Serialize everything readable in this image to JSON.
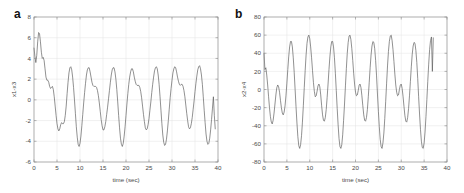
{
  "figure": {
    "background_color": "#ffffff",
    "line_color": "#555555",
    "grid_color": "#e2e2e2",
    "frame_color": "#8a8a8a",
    "text_color": "#4a4a4a"
  },
  "panels": [
    {
      "letter": "a",
      "ylabel": "x1-x3",
      "xlabel": "time (sec)"
    },
    {
      "letter": "b",
      "ylabel": "x2-x4",
      "xlabel": "time (sec)"
    }
  ],
  "chart_data": [
    {
      "type": "line",
      "panel": "a",
      "title": "",
      "xlabel": "time (sec)",
      "ylabel": "x1-x3",
      "xlim": [
        0,
        40
      ],
      "ylim": [
        -6,
        8
      ],
      "xticks": [
        0,
        5,
        10,
        15,
        20,
        25,
        30,
        35,
        40
      ],
      "xticklabels": [
        "0",
        "5",
        "10",
        "15",
        "20",
        "25",
        "30",
        "35",
        "40"
      ],
      "yticks": [
        -6,
        -4,
        -2,
        0,
        2,
        4,
        6,
        8
      ],
      "yticklabels": [
        "-6",
        "-4",
        "-2",
        "0",
        "2",
        "4",
        "6",
        "8"
      ],
      "grid": true,
      "legend": null,
      "series": [
        {
          "name": "x1-x3",
          "color": "#555555",
          "x": [
            0.0,
            0.2,
            0.4,
            0.6,
            0.8,
            1.0,
            1.2,
            1.4,
            1.6,
            1.8,
            2.0,
            2.2,
            2.4,
            2.6,
            2.8,
            3.0,
            3.2,
            3.4,
            3.6,
            3.8,
            4.0,
            4.2,
            4.4,
            4.6,
            4.8,
            5.0,
            5.2,
            5.4,
            5.6,
            5.8,
            6.0,
            6.2,
            6.4,
            6.6,
            6.8,
            7.0,
            7.2,
            7.4,
            7.6,
            7.8,
            8.0,
            8.2,
            8.4,
            8.6,
            8.8,
            9.0,
            9.2,
            9.4,
            9.6,
            9.8,
            10.0,
            10.2,
            10.4,
            10.6,
            10.8,
            11.0,
            11.2,
            11.4,
            11.6,
            11.8,
            12.0,
            12.2,
            12.4,
            12.6,
            12.8,
            13.0,
            13.2,
            13.4,
            13.6,
            13.8,
            14.0,
            14.2,
            14.4,
            14.6,
            14.8,
            15.0,
            15.2,
            15.4,
            15.6,
            15.8,
            16.0,
            16.2,
            16.4,
            16.6,
            16.8,
            17.0,
            17.2,
            17.4,
            17.6,
            17.8,
            18.0,
            18.2,
            18.4,
            18.6,
            18.8,
            19.0,
            19.2,
            19.4,
            19.6,
            19.8,
            20.0,
            20.2,
            20.4,
            20.6,
            20.8,
            21.0,
            21.2,
            21.4,
            21.6,
            21.8,
            22.0,
            22.2,
            22.4,
            22.6,
            22.8,
            23.0,
            23.2,
            23.4,
            23.6,
            23.8,
            24.0,
            24.2,
            24.4,
            24.6,
            24.8,
            25.0,
            25.2,
            25.4,
            25.6,
            25.8,
            26.0,
            26.2,
            26.4,
            26.6,
            26.8,
            27.0,
            27.2,
            27.4,
            27.6,
            27.8,
            28.0,
            28.2,
            28.4,
            28.6,
            28.8,
            29.0,
            29.2,
            29.4,
            29.6,
            29.8,
            30.0,
            30.2,
            30.4,
            30.6,
            30.8,
            31.0,
            31.2,
            31.4,
            31.6,
            31.8,
            32.0,
            32.2,
            32.4,
            32.6,
            32.8,
            33.0,
            33.2,
            33.4,
            33.6,
            33.8,
            34.0,
            34.2,
            34.4,
            34.6,
            34.8,
            35.0,
            35.2,
            35.4,
            35.6,
            35.8,
            36.0,
            36.2,
            36.4,
            36.6,
            36.8,
            37.0,
            37.2,
            37.4,
            37.6,
            37.8,
            38.0,
            38.2,
            38.4,
            38.6,
            38.8,
            39.0,
            39.2,
            39.4,
            39.6,
            39.8,
            40.0
          ],
          "y": [
            5.0,
            4.2,
            3.6,
            4.3,
            5.6,
            6.5,
            6.4,
            5.6,
            4.6,
            4.0,
            4.1,
            3.8,
            3.0,
            2.2,
            1.9,
            1.9,
            1.7,
            1.3,
            1.1,
            1.2,
            1.3,
            1.0,
            0.3,
            -0.6,
            -1.5,
            -2.3,
            -2.8,
            -3.0,
            -2.8,
            -2.4,
            -2.2,
            -2.3,
            -2.3,
            -2.1,
            -1.5,
            -0.6,
            0.6,
            1.7,
            2.6,
            3.1,
            3.2,
            2.9,
            2.2,
            1.2,
            0.0,
            -1.3,
            -2.6,
            -3.6,
            -4.3,
            -4.5,
            -4.2,
            -3.5,
            -2.5,
            -1.4,
            -0.3,
            0.7,
            1.6,
            2.4,
            2.9,
            3.1,
            3.1,
            2.7,
            2.2,
            1.7,
            1.4,
            1.3,
            1.3,
            1.3,
            1.2,
            0.9,
            0.4,
            -0.3,
            -1.1,
            -1.9,
            -2.5,
            -2.9,
            -2.9,
            -2.6,
            -2.1,
            -1.4,
            -0.7,
            0.1,
            0.9,
            1.7,
            2.4,
            2.9,
            3.1,
            3.1,
            2.7,
            2.0,
            1.0,
            -0.2,
            -1.5,
            -2.7,
            -3.7,
            -4.3,
            -4.5,
            -4.2,
            -3.5,
            -2.6,
            -1.5,
            -0.4,
            0.6,
            1.5,
            2.2,
            2.7,
            3.0,
            3.0,
            2.7,
            2.2,
            1.8,
            1.5,
            1.4,
            1.4,
            1.4,
            1.2,
            0.8,
            0.2,
            -0.6,
            -1.4,
            -2.1,
            -2.7,
            -2.9,
            -2.8,
            -2.4,
            -1.8,
            -1.0,
            -0.2,
            0.7,
            1.5,
            2.2,
            2.8,
            3.1,
            3.2,
            3.0,
            2.4,
            1.5,
            0.3,
            -1.0,
            -2.3,
            -3.4,
            -4.1,
            -4.4,
            -4.3,
            -3.8,
            -3.0,
            -2.0,
            -0.9,
            0.2,
            1.1,
            1.9,
            2.6,
            3.0,
            3.2,
            3.1,
            2.7,
            2.2,
            1.8,
            1.5,
            1.4,
            1.5,
            1.5,
            1.3,
            0.9,
            0.3,
            -0.5,
            -1.3,
            -2.0,
            -2.6,
            -2.8,
            -2.7,
            -2.3,
            -1.7,
            -0.9,
            -0.1,
            0.8,
            1.6,
            2.3,
            2.9,
            3.2,
            3.3,
            3.0,
            2.4,
            1.5,
            0.3,
            -1.0,
            -2.2,
            -3.3,
            -4.0,
            -4.3,
            -4.2,
            -3.7,
            -2.9,
            -1.9,
            -0.8,
            0.3,
            -1.5,
            -2.8
          ]
        }
      ]
    },
    {
      "type": "line",
      "panel": "b",
      "title": "",
      "xlabel": "time (sec)",
      "ylabel": "x2-x4",
      "xlim": [
        0,
        40
      ],
      "ylim": [
        -80,
        80
      ],
      "xticks": [
        0,
        5,
        10,
        15,
        20,
        25,
        30,
        35,
        40
      ],
      "xticklabels": [
        "0",
        "5",
        "10",
        "15",
        "20",
        "25",
        "30",
        "35",
        "40"
      ],
      "yticks": [
        -80,
        -60,
        -40,
        -20,
        0,
        20,
        40,
        60,
        80
      ],
      "yticklabels": [
        "-80",
        "-60",
        "-40",
        "-20",
        "0",
        "20",
        "40",
        "60",
        "80"
      ],
      "grid": true,
      "legend": null,
      "series": [
        {
          "name": "x2-x4",
          "color": "#555555",
          "x": [
            0.0,
            0.2,
            0.4,
            0.6,
            0.8,
            1.0,
            1.2,
            1.4,
            1.6,
            1.8,
            2.0,
            2.2,
            2.4,
            2.6,
            2.8,
            3.0,
            3.2,
            3.4,
            3.6,
            3.8,
            4.0,
            4.2,
            4.4,
            4.6,
            4.8,
            5.0,
            5.2,
            5.4,
            5.6,
            5.8,
            6.0,
            6.2,
            6.4,
            6.6,
            6.8,
            7.0,
            7.2,
            7.4,
            7.6,
            7.8,
            8.0,
            8.2,
            8.4,
            8.6,
            8.8,
            9.0,
            9.2,
            9.4,
            9.6,
            9.8,
            10.0,
            10.2,
            10.4,
            10.6,
            10.8,
            11.0,
            11.2,
            11.4,
            11.6,
            11.8,
            12.0,
            12.2,
            12.4,
            12.6,
            12.8,
            13.0,
            13.2,
            13.4,
            13.6,
            13.8,
            14.0,
            14.2,
            14.4,
            14.6,
            14.8,
            15.0,
            15.2,
            15.4,
            15.6,
            15.8,
            16.0,
            16.2,
            16.4,
            16.6,
            16.8,
            17.0,
            17.2,
            17.4,
            17.6,
            17.8,
            18.0,
            18.2,
            18.4,
            18.6,
            18.8,
            19.0,
            19.2,
            19.4,
            19.6,
            19.8,
            20.0,
            20.2,
            20.4,
            20.6,
            20.8,
            21.0,
            21.2,
            21.4,
            21.6,
            21.8,
            22.0,
            22.2,
            22.4,
            22.6,
            22.8,
            23.0,
            23.2,
            23.4,
            23.6,
            23.8,
            24.0,
            24.2,
            24.4,
            24.6,
            24.8,
            25.0,
            25.2,
            25.4,
            25.6,
            25.8,
            26.0,
            26.2,
            26.4,
            26.6,
            26.8,
            27.0,
            27.2,
            27.4,
            27.6,
            27.8,
            28.0,
            28.2,
            28.4,
            28.6,
            28.8,
            29.0,
            29.2,
            29.4,
            29.6,
            29.8,
            30.0,
            30.2,
            30.4,
            30.6,
            30.8,
            31.0,
            31.2,
            31.4,
            31.6,
            31.8,
            32.0,
            32.2,
            32.4,
            32.6,
            32.8,
            33.0,
            33.2,
            33.4,
            33.6,
            33.8,
            34.0,
            34.2,
            34.4,
            34.6,
            34.8,
            35.0,
            35.2,
            35.4,
            35.6,
            35.8,
            36.0,
            36.2,
            36.4,
            36.6,
            36.8,
            37.0,
            37.2,
            37.4,
            37.6,
            37.8,
            38.0,
            38.2,
            38.4,
            38.6,
            38.8,
            39.0,
            39.2,
            39.4,
            39.6,
            39.8,
            40.0
          ],
          "y": [
            40.0,
            22.0,
            24.0,
            16.0,
            5.0,
            -8.0,
            -20.0,
            -30.0,
            -36.0,
            -38.0,
            -34.0,
            -26.0,
            -16.0,
            -6.0,
            2.0,
            5.0,
            3.0,
            -3.0,
            -12.0,
            -20.0,
            -26.0,
            -28.0,
            -25.0,
            -18.0,
            -7.0,
            7.0,
            22.0,
            36.0,
            47.0,
            53.0,
            53.0,
            47.0,
            35.0,
            19.0,
            0.0,
            -19.0,
            -37.0,
            -52.0,
            -62.0,
            -65.0,
            -61.0,
            -51.0,
            -36.0,
            -18.0,
            2.0,
            21.0,
            38.0,
            51.0,
            58.0,
            60.0,
            56.0,
            47.0,
            35.0,
            21.0,
            8.0,
            -2.0,
            -8.0,
            -7.0,
            -2.0,
            4.0,
            6.0,
            3.0,
            -6.0,
            -18.0,
            -28.0,
            -34.0,
            -35.0,
            -31.0,
            -22.0,
            -9.0,
            6.0,
            22.0,
            36.0,
            47.0,
            53.0,
            53.0,
            47.0,
            35.0,
            18.0,
            -1.0,
            -21.0,
            -39.0,
            -54.0,
            -63.0,
            -65.0,
            -61.0,
            -50.0,
            -34.0,
            -16.0,
            4.0,
            23.0,
            40.0,
            52.0,
            59.0,
            60.0,
            55.0,
            45.0,
            32.0,
            18.0,
            6.0,
            -3.0,
            -7.0,
            -6.0,
            -1.0,
            5.0,
            6.0,
            2.0,
            -7.0,
            -18.0,
            -28.0,
            -34.0,
            -35.0,
            -31.0,
            -22.0,
            -8.0,
            8.0,
            24.0,
            38.0,
            48.0,
            53.0,
            52.0,
            45.0,
            32.0,
            15.0,
            -5.0,
            -24.0,
            -41.0,
            -55.0,
            -63.0,
            -65.0,
            -59.0,
            -48.0,
            -32.0,
            -13.0,
            7.0,
            26.0,
            42.0,
            53.0,
            59.0,
            60.0,
            54.0,
            44.0,
            31.0,
            17.0,
            5.0,
            -3.0,
            -7.0,
            -6.0,
            0.0,
            5.0,
            6.0,
            1.0,
            -8.0,
            -19.0,
            -29.0,
            -35.0,
            -36.0,
            -31.0,
            -21.0,
            -7.0,
            9.0,
            25.0,
            39.0,
            48.0,
            52.0,
            51.0,
            43.0,
            30.0,
            12.0,
            -8.0,
            -27.0,
            -44.0,
            -57.0,
            -64.0,
            -65.0,
            -59.0,
            -47.0,
            -30.0,
            -11.0,
            9.0,
            28.0,
            44.0,
            54.0,
            58.0,
            20.0,
            57.0
          ]
        }
      ]
    }
  ]
}
